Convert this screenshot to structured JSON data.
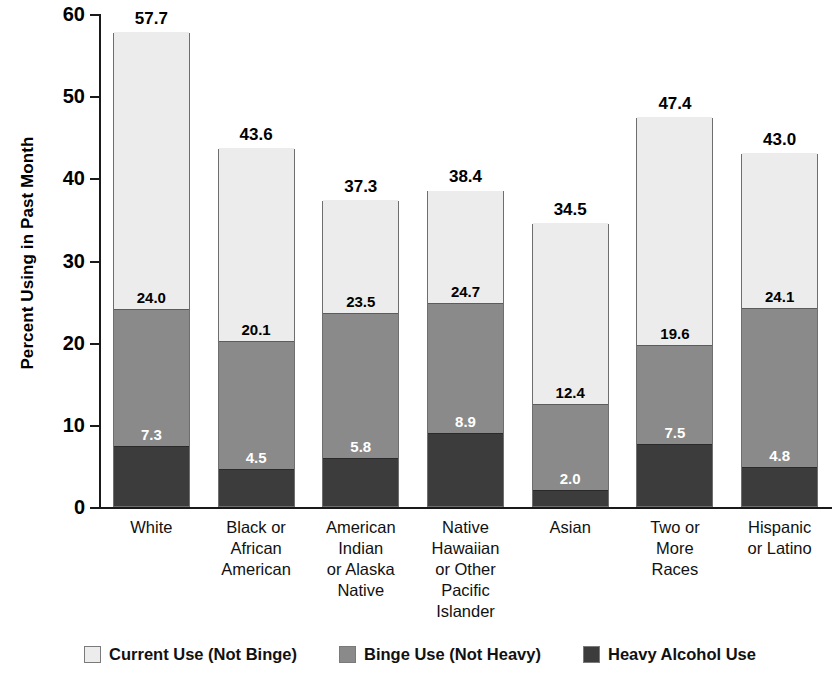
{
  "chart_data": {
    "type": "bar",
    "subtype": "stacked-vertical",
    "title": "",
    "xlabel": "",
    "ylabel": "Percent Using in Past Month",
    "ylim": [
      0,
      60
    ],
    "yticks": [
      0,
      10,
      20,
      30,
      40,
      50,
      60
    ],
    "ytick_labels": [
      "0",
      "10",
      "20",
      "30",
      "40",
      "50",
      "60"
    ],
    "grid": false,
    "legend_position": "bottom",
    "categories": [
      "White",
      "Black or African American",
      "American Indian or Alaska Native",
      "Native Hawaiian or Other Pacific Islander",
      "Asian",
      "Two or More Races",
      "Hispanic or Latino"
    ],
    "category_lines": [
      [
        "White"
      ],
      [
        "Black or",
        "African",
        "American"
      ],
      [
        "American",
        "Indian",
        "or Alaska",
        "Native"
      ],
      [
        "Native",
        "Hawaiian",
        "or Other",
        "Pacific",
        "Islander"
      ],
      [
        "Asian"
      ],
      [
        "Two or",
        "More",
        "Races"
      ],
      [
        "Hispanic",
        "or Latino"
      ]
    ],
    "series": [
      {
        "name": "Heavy Alcohol Use",
        "color": "#3c3c3c",
        "values": [
          7.3,
          4.5,
          5.8,
          8.9,
          2.0,
          7.5,
          4.8
        ],
        "labels_shown": false
      },
      {
        "name": "Binge Use (Not Heavy)",
        "color": "#8a8a8a",
        "values": [
          16.7,
          15.6,
          17.7,
          15.8,
          10.4,
          12.1,
          19.3
        ],
        "labels_shown": true,
        "label_values": [
          "7.3",
          "4.5",
          "5.8",
          "8.9",
          "2.0",
          "7.5",
          "4.8"
        ],
        "label_note": "cumulative value at top of dark segment printed inside medium segment"
      },
      {
        "name": "Current Use (Not Binge)",
        "color": "#ececec",
        "values": [
          33.7,
          23.5,
          13.8,
          13.7,
          22.1,
          27.8,
          18.9
        ],
        "labels_shown": true,
        "label_values": [
          "24.0",
          "20.1",
          "23.5",
          "24.7",
          "12.4",
          "19.6",
          "24.1"
        ],
        "label_note": "cumulative value at top of medium segment printed inside light segment"
      }
    ],
    "cumulative_heavy": [
      7.3,
      4.5,
      5.8,
      8.9,
      2.0,
      7.5,
      4.8
    ],
    "cumulative_binge": [
      24.0,
      20.1,
      23.5,
      24.7,
      12.4,
      19.6,
      24.1
    ],
    "totals": [
      57.7,
      43.6,
      37.3,
      38.4,
      34.5,
      47.4,
      43.0
    ],
    "total_labels": [
      "57.7",
      "43.6",
      "37.3",
      "38.4",
      "34.5",
      "47.4",
      "43.0"
    ]
  },
  "legend": {
    "items": [
      {
        "label": "Current Use (Not Binge)",
        "color": "#ececec"
      },
      {
        "label": "Binge Use (Not Heavy)",
        "color": "#8a8a8a"
      },
      {
        "label": "Heavy Alcohol Use",
        "color": "#3c3c3c"
      }
    ]
  }
}
